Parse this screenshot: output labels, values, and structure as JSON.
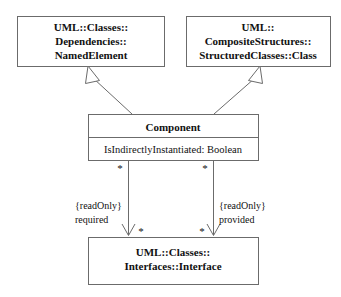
{
  "diagram": {
    "background_color": "#ffffff",
    "line_color": "#6b6b6b",
    "text_color": "#111111",
    "classes": [
      {
        "id": "named-element",
        "name_lines": [
          "UML::Classes::",
          "Dependencies::",
          "NamedElement"
        ],
        "attributes": []
      },
      {
        "id": "structured-class",
        "name_lines": [
          "UML::",
          "CompositeStructures::",
          "StructuredClasses::Class"
        ],
        "attributes": []
      },
      {
        "id": "component",
        "name_lines": [
          "Component"
        ],
        "attributes": [
          "IsIndirectlyInstantiated: Boolean"
        ]
      },
      {
        "id": "interface",
        "name_lines": [
          "UML::Classes::",
          "Interfaces::Interface"
        ],
        "attributes": []
      }
    ],
    "generalizations": [
      {
        "id": "component-to-namedelement",
        "from": "component",
        "to": "named-element"
      },
      {
        "id": "component-to-structuredclass",
        "from": "component",
        "to": "structured-class"
      }
    ],
    "associations": [
      {
        "id": "required",
        "from": "component",
        "to": "interface",
        "role_name": "required",
        "constraint": "{readOnly}",
        "source_multiplicity": "*",
        "target_multiplicity": "*"
      },
      {
        "id": "provided",
        "from": "component",
        "to": "interface",
        "role_name": "provided",
        "constraint": "{readOnly}",
        "source_multiplicity": "*",
        "target_multiplicity": "*"
      }
    ]
  }
}
